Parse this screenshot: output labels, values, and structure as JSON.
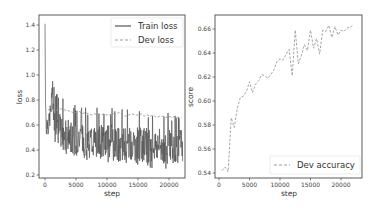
{
  "chart_data": [
    {
      "type": "line",
      "title": "",
      "xlabel": "step",
      "ylabel": "loss",
      "xlim": [
        -1100,
        23200
      ],
      "ylim": [
        0.18,
        1.45
      ],
      "xticks": [
        0,
        5000,
        10000,
        15000,
        20000
      ],
      "xtick_labels": [
        "0",
        "5000",
        "10000",
        "15000",
        "20000"
      ],
      "yticks": [
        0.2,
        0.4,
        0.6,
        0.8,
        1.0,
        1.2,
        1.4
      ],
      "ytick_labels": [
        "0.2",
        "0.4",
        "0.6",
        "0.8",
        "1.0",
        "1.2",
        "1.4"
      ],
      "grid": false,
      "legend_position": "upper right",
      "series": [
        {
          "name": "Train loss",
          "style": "solid",
          "color": "#555555",
          "x": [
            0,
            100,
            200,
            400,
            600,
            800,
            1000,
            1200,
            1400,
            1600,
            2000,
            2500,
            3000,
            3500,
            4000,
            4500,
            5000,
            5500,
            6000,
            6500,
            7000,
            7500,
            8000,
            8500,
            9000,
            9500,
            10000,
            10500,
            11000,
            11500,
            12000,
            12500,
            13000,
            13500,
            14000,
            14500,
            15000,
            15500,
            16000,
            16500,
            17000,
            17500,
            18000,
            18500,
            19000,
            19500,
            20000,
            20500,
            21000,
            21500,
            22000,
            22200
          ],
          "y": [
            1.41,
            0.76,
            0.6,
            0.62,
            0.58,
            0.68,
            0.72,
            0.93,
            0.75,
            0.62,
            0.58,
            0.55,
            0.53,
            0.52,
            0.5,
            0.5,
            0.49,
            0.5,
            0.47,
            0.48,
            0.47,
            0.49,
            0.46,
            0.48,
            0.47,
            0.46,
            0.47,
            0.47,
            0.46,
            0.46,
            0.45,
            0.45,
            0.46,
            0.45,
            0.46,
            0.44,
            0.45,
            0.44,
            0.44,
            0.45,
            0.43,
            0.44,
            0.44,
            0.43,
            0.43,
            0.42,
            0.44,
            0.42,
            0.43,
            0.43,
            0.44,
            0.42
          ],
          "band_low": 0.25,
          "band_high": 0.76,
          "note": "highly noisy; values are smoothed centerline; spikes range roughly 0.25-0.76 after step 2000"
        },
        {
          "name": "Dev loss",
          "style": "dashed",
          "color": "#999999",
          "x": [
            500,
            1000,
            1500,
            2000,
            2500,
            3000,
            3500,
            4000,
            4500,
            5000,
            5500,
            6000,
            6500,
            7000,
            7500,
            8000,
            8500,
            9000,
            9500,
            10000,
            10500,
            11000,
            11500,
            12000,
            12500,
            13000,
            13500,
            14000,
            14500,
            15000,
            15500,
            16000,
            16500,
            17000,
            17500,
            18000,
            18500,
            19000,
            19500,
            20000,
            20500,
            21000,
            21500,
            22000
          ],
          "y": [
            0.72,
            0.73,
            0.72,
            0.72,
            0.73,
            0.72,
            0.72,
            0.71,
            0.7,
            0.7,
            0.71,
            0.69,
            0.7,
            0.69,
            0.68,
            0.69,
            0.68,
            0.68,
            0.69,
            0.68,
            0.68,
            0.69,
            0.69,
            0.7,
            0.68,
            0.67,
            0.68,
            0.69,
            0.68,
            0.68,
            0.69,
            0.67,
            0.68,
            0.67,
            0.68,
            0.66,
            0.67,
            0.67,
            0.66,
            0.67,
            0.66,
            0.67,
            0.66,
            0.66
          ]
        }
      ]
    },
    {
      "type": "line",
      "title": "",
      "xlabel": "step",
      "ylabel": "score",
      "xlim": [
        -1100,
        23200
      ],
      "ylim": [
        0.537,
        0.67
      ],
      "xticks": [
        0,
        5000,
        10000,
        15000,
        20000
      ],
      "xtick_labels": [
        "0",
        "5000",
        "10000",
        "15000",
        "20000"
      ],
      "yticks": [
        0.54,
        0.56,
        0.58,
        0.6,
        0.62,
        0.64,
        0.66
      ],
      "ytick_labels": [
        "0.54",
        "0.56",
        "0.58",
        "0.60",
        "0.62",
        "0.64",
        "0.66"
      ],
      "grid": false,
      "legend_position": "lower right",
      "series": [
        {
          "name": "Dev accuracy",
          "style": "dashed",
          "color": "#999999",
          "x": [
            500,
            1000,
            1500,
            2000,
            2500,
            3000,
            3500,
            4000,
            4500,
            5000,
            5500,
            6000,
            6500,
            7000,
            7500,
            8000,
            8500,
            9000,
            9500,
            10000,
            10500,
            11000,
            11500,
            12000,
            12500,
            13000,
            13500,
            14000,
            14500,
            15000,
            15500,
            16000,
            16500,
            17000,
            17500,
            18000,
            18500,
            19000,
            19500,
            20000,
            20500,
            21000,
            21500,
            22000
          ],
          "y": [
            0.542,
            0.545,
            0.541,
            0.586,
            0.578,
            0.594,
            0.603,
            0.604,
            0.608,
            0.616,
            0.607,
            0.614,
            0.617,
            0.622,
            0.621,
            0.619,
            0.622,
            0.626,
            0.633,
            0.635,
            0.634,
            0.639,
            0.643,
            0.621,
            0.659,
            0.631,
            0.638,
            0.647,
            0.642,
            0.659,
            0.644,
            0.652,
            0.639,
            0.659,
            0.658,
            0.663,
            0.653,
            0.662,
            0.655,
            0.659,
            0.658,
            0.661,
            0.661,
            0.664
          ]
        }
      ]
    }
  ],
  "left_plot": {
    "ylabel": "loss",
    "xlabel": "step",
    "legend": [
      "Train loss",
      "Dev loss"
    ],
    "yticks": [
      "0.2",
      "0.4",
      "0.6",
      "0.8",
      "1.0",
      "1.2",
      "1.4"
    ],
    "xticks": [
      "0",
      "5000",
      "10000",
      "15000",
      "20000"
    ]
  },
  "right_plot": {
    "ylabel": "score",
    "xlabel": "step",
    "legend": [
      "Dev accuracy"
    ],
    "yticks": [
      "0.54",
      "0.56",
      "0.58",
      "0.60",
      "0.62",
      "0.64",
      "0.66"
    ],
    "xticks": [
      "0",
      "5000",
      "10000",
      "15000",
      "20000"
    ]
  },
  "colors": {
    "train": "#555555",
    "dev": "#9a9a9a",
    "frame": "#333333"
  }
}
